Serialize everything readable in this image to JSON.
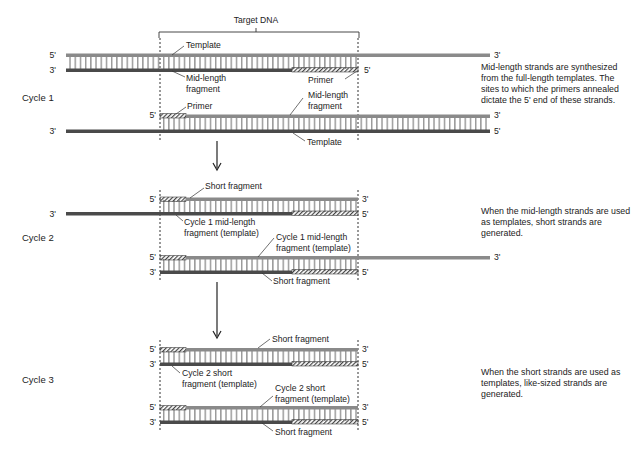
{
  "title": "Target DNA",
  "cycles": [
    {
      "label": "Cycle 1",
      "description": "Mid-length strands are synthesized from the full-length templates. The sites to which the primers annealed dictate the 5' end of these strands.",
      "labels": {
        "template_top": "Template",
        "midlength_top_1": "Mid-length",
        "midlength_top_2": "fragment",
        "primer_right": "Primer",
        "primer_left": "Primer",
        "midlength_bottom_1": "Mid-length",
        "midlength_bottom_2": "fragment",
        "template_bottom": "Template"
      }
    },
    {
      "label": "Cycle 2",
      "description": "When the mid-length strands are used as templates, short strands are generated.",
      "labels": {
        "short_top": "Short fragment",
        "c1_template_top_1": "Cycle 1 mid-length",
        "c1_template_top_2": "fragment (template)",
        "c1_template_bottom_1": "Cycle 1 mid-length",
        "c1_template_bottom_2": "fragment (template)",
        "short_bottom": "Short fragment"
      }
    },
    {
      "label": "Cycle 3",
      "description": "When the short strands are used as templates, like-sized strands are generated.",
      "labels": {
        "short_top": "Short fragment",
        "c2_template_top_1": "Cycle 2 short",
        "c2_template_top_2": "fragment (template)",
        "c2_template_bottom_1": "Cycle 2 short",
        "c2_template_bottom_2": "fragment (template)",
        "short_bottom": "Short fragment"
      }
    }
  ],
  "ends": {
    "five": "5'",
    "three": "3'"
  },
  "colors": {
    "strand_light": "#8a8a8a",
    "strand_dark": "#4a4a4a",
    "rung": "#777777",
    "text": "#222222"
  }
}
